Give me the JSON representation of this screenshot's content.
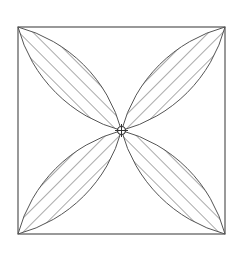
{
  "diagram": {
    "type": "geometric-figure",
    "colors": {
      "background": "#ffffff",
      "stroke": "#555555",
      "hatch": "#555555"
    },
    "square": {
      "x": 18,
      "y": 27,
      "size": 207
    },
    "center_circle": {
      "radius": 4
    },
    "petals": [
      {
        "name": "top-left",
        "hatch_direction": "/"
      },
      {
        "name": "top-right",
        "hatch_direction": "\\"
      },
      {
        "name": "bottom-left",
        "hatch_direction": "\\"
      },
      {
        "name": "bottom-right",
        "hatch_direction": "/"
      }
    ]
  }
}
